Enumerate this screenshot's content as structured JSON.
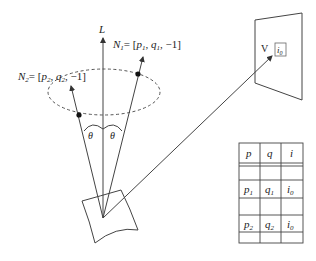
{
  "diagram": {
    "axis_label": "L",
    "normals": [
      {
        "name": "N",
        "sub": "1",
        "eq": "= [",
        "p": "p",
        "psub": "1",
        "q": "q",
        "qsub": "1",
        "tail": ", −1]"
      },
      {
        "name": "N",
        "sub": "2",
        "eq": "= [",
        "p": "p",
        "psub": "2",
        "q": "q",
        "qsub": "2",
        "tail": ", −1]"
      }
    ],
    "angle_label": "θ",
    "viewer_label": "V",
    "pixel_label": {
      "base": "i",
      "sub": "0"
    }
  },
  "table": {
    "headers": [
      "p",
      "q",
      "i"
    ],
    "rows": [
      {
        "p": "p",
        "psub": "1",
        "q": "q",
        "qsub": "1",
        "i": "i",
        "isub": "0"
      },
      {
        "p": "p",
        "psub": "2",
        "q": "q",
        "qsub": "2",
        "i": "i",
        "isub": "0"
      }
    ]
  },
  "colors": {
    "line": "#444444",
    "text": "#222222",
    "background": "#ffffff"
  }
}
